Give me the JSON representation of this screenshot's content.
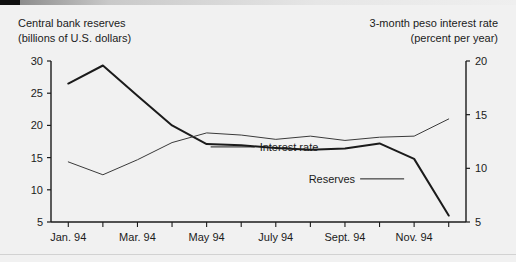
{
  "figure": {
    "background_color": "#f1f1f1",
    "header_left_line1": "Central bank reserves",
    "header_left_line2": "(billions of U.S. dollars)",
    "header_right_line1": "3-month peso interest rate",
    "header_right_line2": "(percent per year)"
  },
  "chart_data": {
    "type": "line",
    "title": "",
    "subtitle": "",
    "xlabel": "",
    "ylabel": "Central bank reserves (billions of U.S. dollars)",
    "y2label": "3-month peso interest rate (percent per year)",
    "grid": false,
    "legend_position": "inline-annotations",
    "x": [
      "Jan. 94",
      "Feb. 94",
      "Mar. 94",
      "Apr. 94",
      "May 94",
      "June 94",
      "July 94",
      "Aug. 94",
      "Sept. 94",
      "Oct. 94",
      "Nov. 94",
      "Dec. 94"
    ],
    "xtick_labels": [
      "Jan. 94",
      "Mar. 94",
      "May 94",
      "July 94",
      "Sept. 94",
      "Nov. 94"
    ],
    "ylim": [
      5,
      30
    ],
    "yticks": [
      5,
      10,
      15,
      20,
      25,
      30
    ],
    "y2lim": [
      5,
      20
    ],
    "y2ticks": [
      5,
      10,
      15,
      20
    ],
    "series": [
      {
        "name": "Reserves",
        "axis": "left",
        "color": "#1b1b1b",
        "line_width": 2.0,
        "annotation": "Reserves",
        "values": [
          26.5,
          29.3,
          24.6,
          20.0,
          17.1,
          16.9,
          16.5,
          16.2,
          16.4,
          17.2,
          14.8,
          6.0
        ]
      },
      {
        "name": "Interest rate",
        "axis": "right",
        "color": "#3a3a3a",
        "line_width": 1.0,
        "annotation": "Interest rate",
        "values": [
          10.6,
          9.4,
          10.8,
          12.4,
          13.3,
          13.1,
          12.7,
          13.0,
          12.6,
          12.9,
          13.0,
          14.6
        ]
      }
    ],
    "annotations": [
      {
        "text": "Interest rate",
        "target_series": "Interest rate"
      },
      {
        "text": "Reserves",
        "target_series": "Reserves"
      }
    ]
  }
}
